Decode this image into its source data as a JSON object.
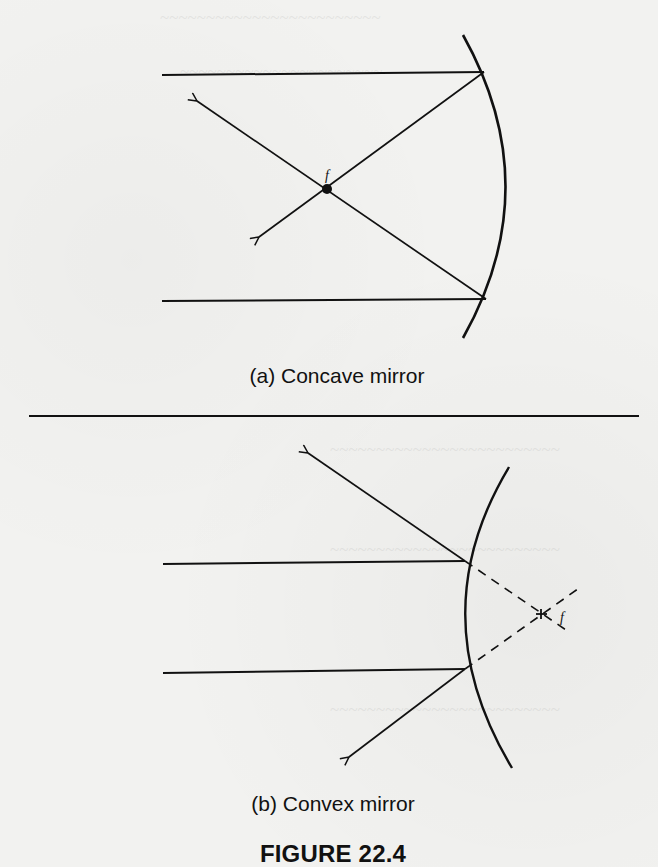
{
  "figure": {
    "title": "FIGURE 22.4",
    "panels": [
      {
        "id": "a",
        "caption": "(a) Concave mirror",
        "mirror_type": "concave",
        "focal_label": "f",
        "focus": "real",
        "incident_rays": 2,
        "reflected_rays": 2
      },
      {
        "id": "b",
        "caption": "(b) Convex mirror",
        "mirror_type": "convex",
        "focal_label": "f",
        "focus": "virtual",
        "incident_rays": 2,
        "reflected_rays": 2
      }
    ]
  },
  "colors": {
    "ink": "#111111",
    "paper": "#f2f2f0"
  }
}
